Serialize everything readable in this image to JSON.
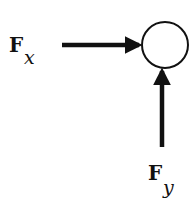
{
  "diagram": {
    "type": "force-diagram",
    "body": {
      "shape": "circle",
      "cx": 165,
      "cy": 45,
      "r": 23
    },
    "forces": [
      {
        "id": "fx",
        "label_main": "F",
        "label_sub": "x",
        "direction": "right",
        "from": [
          62,
          45
        ],
        "to": [
          142,
          45
        ]
      },
      {
        "id": "fy",
        "label_main": "F",
        "label_sub": "y",
        "direction": "up",
        "from": [
          162,
          147
        ],
        "to": [
          162,
          68
        ]
      }
    ],
    "colors": {
      "stroke": "#111111",
      "background": "#ffffff"
    }
  }
}
